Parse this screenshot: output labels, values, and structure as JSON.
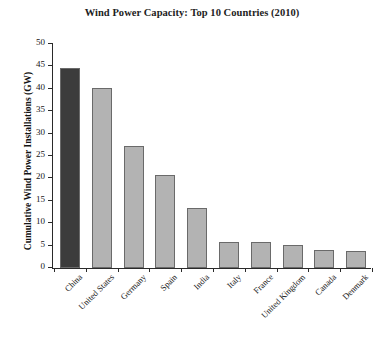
{
  "chart_data": {
    "type": "bar",
    "title": "Wind Power Capacity: Top 10 Countries (2010)",
    "xlabel": "",
    "ylabel": "Cumulative Wind Power Installations (GW)",
    "categories": [
      "China",
      "United States",
      "Germany",
      "Spain",
      "India",
      "Italy",
      "France",
      "United Kingdom",
      "Canada",
      "Denmark"
    ],
    "values": [
      44.7,
      40.2,
      27.2,
      20.7,
      13.4,
      5.8,
      5.7,
      5.2,
      4.0,
      3.8
    ],
    "ylim": [
      0,
      50
    ],
    "yticks": [
      0,
      5,
      10,
      15,
      20,
      25,
      30,
      35,
      40,
      45,
      50
    ],
    "ytick_labels": [
      "0",
      "5",
      "10",
      "15",
      "20",
      "25",
      "30",
      "35",
      "40",
      "45",
      "50"
    ],
    "grid": false,
    "legend": false,
    "bar_colors": [
      "#3c3c3c",
      "#b3b3b3",
      "#b3b3b3",
      "#b3b3b3",
      "#b3b3b3",
      "#b3b3b3",
      "#b3b3b3",
      "#b3b3b3",
      "#b3b3b3",
      "#b3b3b3"
    ],
    "bar_edge_color": "#6a6a6a",
    "highlight_color": "#3c3c3c",
    "default_bar_color": "#b3b3b3",
    "axis_color": "#2a2a2a",
    "background_color": "#ffffff"
  }
}
